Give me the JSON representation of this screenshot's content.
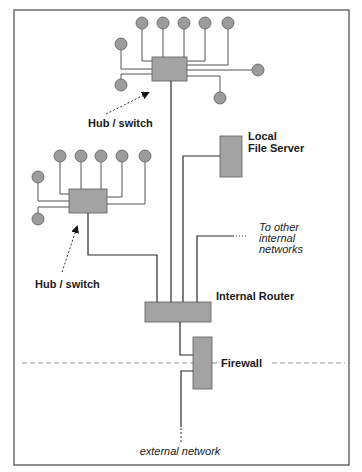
{
  "diagram": {
    "colors": {
      "device_fill": "#a3a3a3",
      "device_stroke": "#5a5a5a",
      "wire": "#2a2a2a",
      "dashed_boundary": "#999999",
      "frame": "#555555"
    },
    "labels": {
      "hub_top": "Hub / switch",
      "hub_left": "Hub / switch",
      "file_server_line1": "Local",
      "file_server_line2": "File Server",
      "other_networks_line1": "To other",
      "other_networks_line2": "internal",
      "other_networks_line3": "networks",
      "router": "Internal Router",
      "firewall": "Firewall",
      "external": "external network"
    },
    "nodes": {
      "hub_top_clients": 9,
      "hub_left_clients": 7
    }
  }
}
